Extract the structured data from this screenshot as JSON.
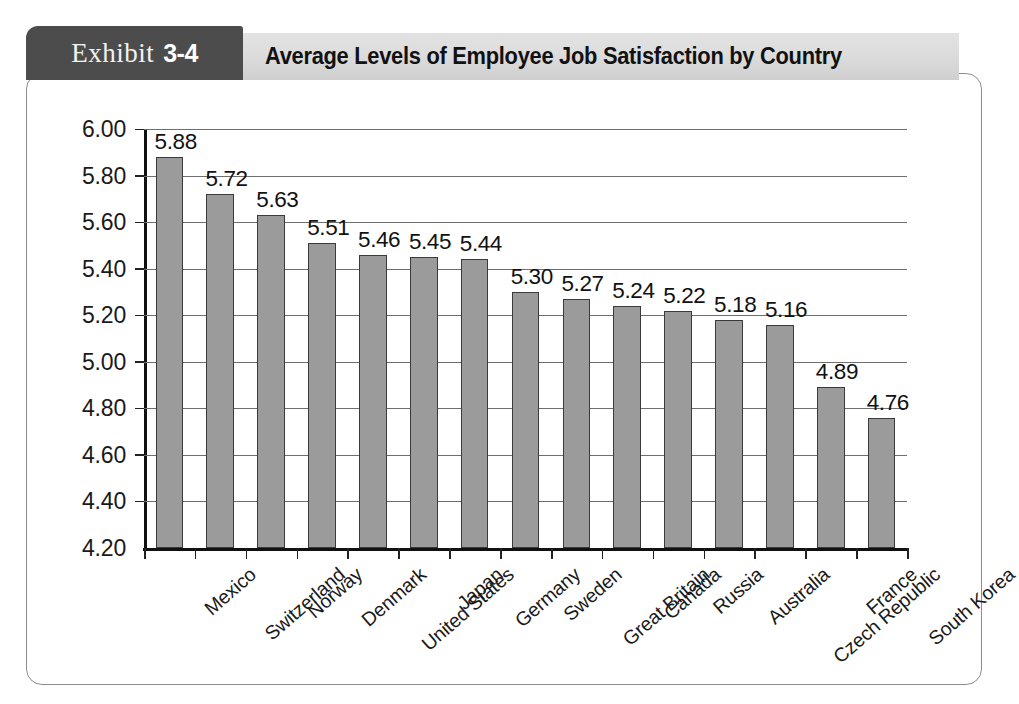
{
  "exhibit": {
    "word": "Exhibit",
    "number": "3-4"
  },
  "header": {
    "title": "Average Levels of Employee Job Satisfaction by Country"
  },
  "colors": {
    "tab_background": "#4c4c4c",
    "title_band": "#dddddd",
    "bar_fill": "#9b9b9b",
    "bar_border": "#3a3a3a",
    "gridline": "#6f6f6f",
    "axis": "#111111",
    "card_border": "#8d8d8d"
  },
  "chart_data": {
    "type": "bar",
    "title": "Average Levels of Employee Job Satisfaction by Country",
    "xlabel": "",
    "ylabel": "",
    "ylim": [
      4.2,
      6.0
    ],
    "ytick_step": 0.2,
    "grid": true,
    "legend": "none",
    "ytick_labels": [
      "6.00",
      "5.80",
      "5.60",
      "5.40",
      "5.20",
      "5.00",
      "4.80",
      "4.60",
      "4.40",
      "4.20"
    ],
    "yticks": [
      6.0,
      5.8,
      5.6,
      5.4,
      5.2,
      5.0,
      4.8,
      4.6,
      4.4,
      4.2
    ],
    "categories": [
      "Mexico",
      "Switzerland",
      "Norway",
      "Denmark",
      "United States",
      "Japan",
      "Germany",
      "Sweden",
      "Great Britain",
      "Canada",
      "Russia",
      "Australia",
      "Czech Republic",
      "France",
      "South Korea"
    ],
    "values": [
      5.88,
      5.72,
      5.63,
      5.51,
      5.46,
      5.45,
      5.44,
      5.3,
      5.27,
      5.24,
      5.22,
      5.18,
      5.16,
      4.89,
      4.76
    ],
    "value_labels": [
      "5.88",
      "5.72",
      "5.63",
      "5.51",
      "5.46",
      "5.45",
      "5.44",
      "5.30",
      "5.27",
      "5.24",
      "5.22",
      "5.18",
      "5.16",
      "4.89",
      "4.76"
    ]
  }
}
